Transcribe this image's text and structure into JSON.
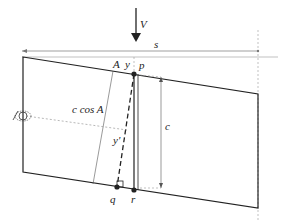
{
  "diagram": {
    "labels": {
      "force": "V",
      "span": "s",
      "angle": "A",
      "offset_top": "y",
      "point_p": "p",
      "projection": "c cos A",
      "offset_inner": "y'",
      "height": "c",
      "point_q": "q",
      "point_r": "r"
    },
    "colors": {
      "stroke": "#222222",
      "thin": "#555555",
      "dashed": "#888888"
    }
  }
}
